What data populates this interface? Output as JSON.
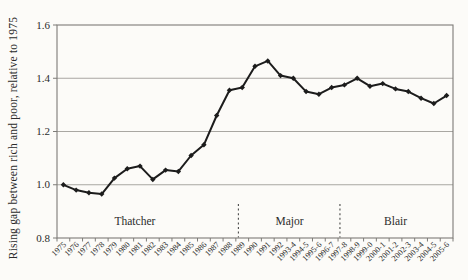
{
  "chart_data": {
    "type": "line",
    "title": "",
    "xlabel": "",
    "ylabel": "Rising gap between rich and poor, relative to 1975",
    "categories": [
      "1975",
      "1976",
      "1977",
      "1978",
      "1979",
      "1980",
      "1981",
      "1982",
      "1983",
      "1984",
      "1985",
      "1986",
      "1987",
      "1988",
      "1989",
      "1990",
      "1991",
      "1992",
      "1993-4",
      "1994-5",
      "1995-6",
      "1996-7",
      "1997-8",
      "1998-9",
      "1999-0",
      "2000-1",
      "2001-2",
      "2002-3",
      "2003-4",
      "2004-5",
      "2005-6"
    ],
    "series": [
      {
        "name": "Gap between rich and poor relative to 1975",
        "values": [
          1.0,
          0.98,
          0.97,
          0.965,
          1.025,
          1.06,
          1.07,
          1.02,
          1.055,
          1.05,
          1.11,
          1.15,
          1.26,
          1.355,
          1.365,
          1.445,
          1.465,
          1.41,
          1.4,
          1.35,
          1.34,
          1.365,
          1.375,
          1.4,
          1.37,
          1.38,
          1.36,
          1.35,
          1.325,
          1.305,
          1.335
        ]
      }
    ],
    "ylim": [
      0.8,
      1.6
    ],
    "yticks": [
      0.8,
      1.0,
      1.2,
      1.4,
      1.6
    ],
    "ytick_labels": [
      "0.8",
      "1.0",
      "1.2",
      "1.4",
      "1.6"
    ],
    "grid": "horizontal",
    "legend": "none",
    "marker": "diamond",
    "annotations": {
      "era_labels": [
        {
          "label": "Thatcher",
          "pos": 6.1
        },
        {
          "label": "Major",
          "pos": 18.2
        },
        {
          "label": "Blair",
          "pos": 26.5
        }
      ],
      "dividers": [
        14.2,
        22.15
      ]
    },
    "colors": {
      "line": "#1c1c1c",
      "marker": "#1c1c1c",
      "grid": "#a9a7a2",
      "axis": "#7d7b77",
      "divider": "#4a4a4a",
      "text": "#2b2b2b",
      "background": "#fcfbf8"
    }
  }
}
